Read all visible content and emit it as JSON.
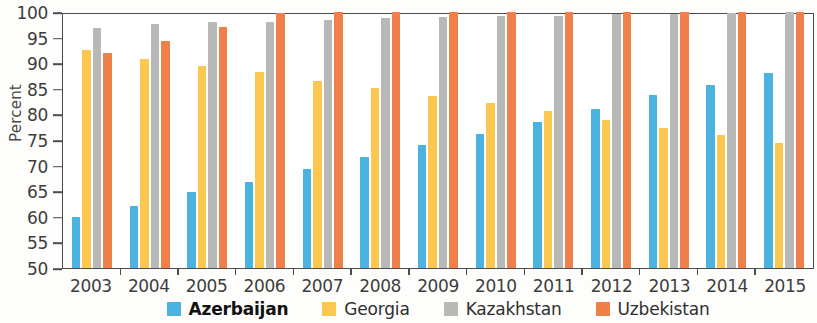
{
  "chart_data": {
    "type": "bar",
    "title": "",
    "xlabel": "",
    "ylabel": "Percent",
    "ylim": [
      50,
      100
    ],
    "ytick_step": 5,
    "grid": false,
    "legend_position": "bottom",
    "categories": [
      "2003",
      "2004",
      "2005",
      "2006",
      "2007",
      "2008",
      "2009",
      "2010",
      "2011",
      "2012",
      "2013",
      "2014",
      "2015"
    ],
    "yticks": [
      "100",
      "95",
      "90",
      "85",
      "80",
      "75",
      "70",
      "65",
      "60",
      "55",
      "50"
    ],
    "series": [
      {
        "name": "Azerbaijan",
        "color": "#4BB3E0",
        "emphasis": "bold",
        "values": [
          60.0,
          62.2,
          64.8,
          66.8,
          69.4,
          71.7,
          74.0,
          76.2,
          78.6,
          81.0,
          83.8,
          85.8,
          88.1
        ]
      },
      {
        "name": "Georgia",
        "color": "#FBC74F",
        "emphasis": "normal",
        "values": [
          92.5,
          90.9,
          89.4,
          88.3,
          86.6,
          85.1,
          83.5,
          82.2,
          80.6,
          79.0,
          77.4,
          76.0,
          74.5
        ]
      },
      {
        "name": "Kazakhstan",
        "color": "#B8B8B6",
        "emphasis": "normal",
        "values": [
          96.9,
          97.6,
          98.0,
          98.1,
          98.5,
          98.8,
          99.1,
          99.3,
          99.2,
          99.6,
          99.7,
          99.8,
          100.0
        ]
      },
      {
        "name": "Uzbekistan",
        "color": "#F08049",
        "emphasis": "normal",
        "values": [
          91.9,
          94.4,
          97.0,
          99.8,
          100.0,
          100.0,
          100.0,
          100.0,
          100.0,
          100.0,
          100.0,
          100.0,
          100.0
        ]
      }
    ]
  },
  "legend": {
    "items": [
      {
        "label": "Azerbaijan",
        "color": "#4BB3E0",
        "bold": true
      },
      {
        "label": "Georgia",
        "color": "#FBC74F",
        "bold": false
      },
      {
        "label": "Kazakhstan",
        "color": "#B8B8B6",
        "bold": false
      },
      {
        "label": "Uzbekistan",
        "color": "#F08049",
        "bold": false
      }
    ]
  }
}
